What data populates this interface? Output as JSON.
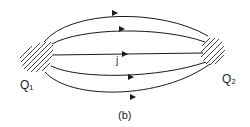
{
  "figure": {
    "caption": "(b)",
    "current_label": "j",
    "left_charge_label": "Q₁",
    "right_charge_label": "Q₂",
    "line_color": "#1a1a1a",
    "field_lines": 5,
    "arrow_direction": "left-to-right"
  }
}
